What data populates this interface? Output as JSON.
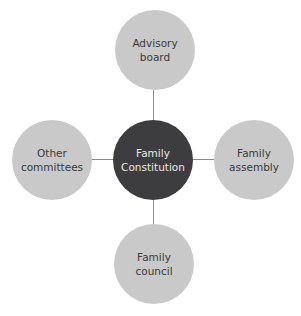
{
  "diagram": {
    "type": "hub-and-spoke",
    "center": {
      "label": "Family\nConstitution",
      "color": "#3d3d3f"
    },
    "nodes": [
      {
        "position": "top",
        "label": "Advisory\nboard"
      },
      {
        "position": "left",
        "label": "Other\ncommittees"
      },
      {
        "position": "right",
        "label": "Family\nassembly"
      },
      {
        "position": "bottom",
        "label": "Family\ncouncil"
      }
    ],
    "node_color": "#c9c9c9",
    "connector_color": "#8c8c8c"
  }
}
